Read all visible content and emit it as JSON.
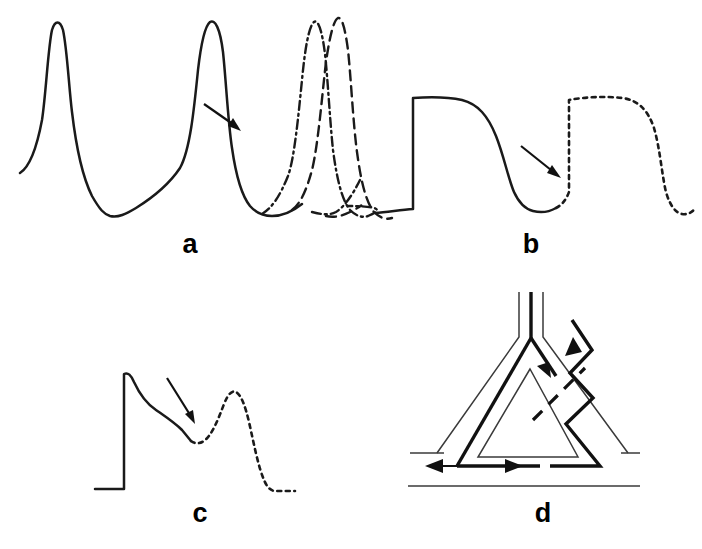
{
  "figure": {
    "background_color": "#ffffff",
    "ink_color": "#1a1a1a",
    "width": 702,
    "height": 549
  },
  "panels": [
    {
      "id": "a",
      "label": "a",
      "label_x": 190,
      "label_y": 253,
      "title": "Abnormal automaticity / triggered pacemaker activity",
      "traces": [
        {
          "name": "baseline-pacemaker-action-potentials",
          "style": "solid",
          "description": "Two spontaneous pacemaker action potentials with slow phase-4 diastolic depolarization"
        },
        {
          "name": "accelerated-beat-dash-dot",
          "style": "dash-dot",
          "description": "Premature accelerated upstroke arising early from the diastolic slope"
        },
        {
          "name": "accelerated-beat-dashed",
          "style": "dashed",
          "description": "Second accelerated beat occurring slightly later"
        }
      ],
      "arrow": {
        "name": "automaticity-arrow",
        "direction": "down-right",
        "points_to": "onset of accelerated phase-4 depolarization"
      }
    },
    {
      "id": "b",
      "label": "b",
      "label_x": 531,
      "label_y": 253,
      "title": "Early afterdepolarization (EAD)",
      "traces": [
        {
          "name": "control-action-potential",
          "style": "solid",
          "description": "Action potential with plateau and repolarization to baseline"
        },
        {
          "name": "ead-triggered-response",
          "style": "dotted",
          "description": "Dotted trace showing secondary upstroke from the late plateau producing a triggered beat"
        }
      ],
      "arrow": {
        "name": "ead-arrow",
        "direction": "down-right",
        "points_to": "take-off point of the early afterdepolarization"
      }
    },
    {
      "id": "c",
      "label": "c",
      "label_x": 200,
      "label_y": 522,
      "title": "Delayed afterdepolarization (DAD)",
      "traces": [
        {
          "name": "control-action-potential",
          "style": "solid",
          "description": "Rapid upstroke with spike and declining plateau"
        },
        {
          "name": "dad-oscillation",
          "style": "dotted",
          "description": "Dotted oscillatory hump after repolarization returning to baseline"
        }
      ],
      "arrow": {
        "name": "dad-arrow",
        "direction": "down-right",
        "points_to": "trough preceding the delayed afterdepolarization hump"
      }
    },
    {
      "id": "d",
      "label": "d",
      "label_x": 543,
      "label_y": 522,
      "title": "Reentry circuit with unidirectional block",
      "elements": [
        {
          "name": "common-proximal-pathway",
          "style": "thin-outline",
          "description": "Vertical trunk entering the circuit and bifurcating at the apex"
        },
        {
          "name": "fast-pathway-left-limb",
          "style": "bold",
          "description": "Bold antegrade limb conducting down the left side of the triangle"
        },
        {
          "name": "slow-pathway-right-limb",
          "style": "bold-zigzag",
          "description": "Zigzag bold limb indicating slow retrograde conduction"
        },
        {
          "name": "unidirectional-block",
          "style": "heavy-dashed-diagonal",
          "description": "Heavy dashed bar marking the site of unidirectional block"
        },
        {
          "name": "distal-common-pathway",
          "style": "thin-outline",
          "description": "Horizontal distal tissue rails at the base of the circuit"
        }
      ],
      "arrows": [
        {
          "name": "antegrade-arrow",
          "direction": "down-right",
          "description": "Antegrade wavefront entering the circuit"
        },
        {
          "name": "retrograde-arrow",
          "direction": "up-right",
          "description": "Retrograde wavefront returning through the slow pathway"
        },
        {
          "name": "bidirectional-spread-arrow",
          "direction": "left-and-right",
          "description": "Double-headed arrow showing spread along the distal common pathway"
        }
      ]
    }
  ]
}
